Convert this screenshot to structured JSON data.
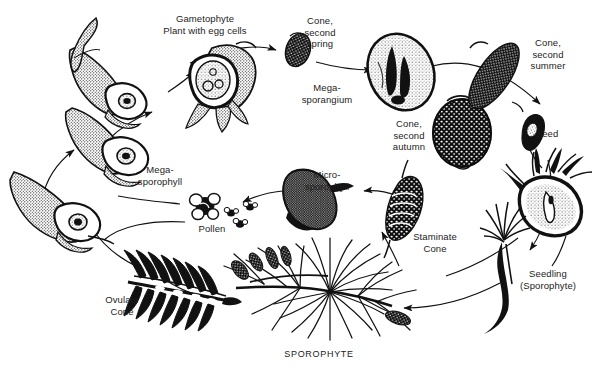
{
  "figure": {
    "background_color": "#ffffff",
    "ink_color": "#111111",
    "text_color": "#1c1c1c",
    "width": 599,
    "height": 374
  },
  "labels": [
    {
      "id": "gametophyte",
      "text": "Gametophyte\nPlant with egg cells",
      "x": 205,
      "y": 21,
      "w": 118
    },
    {
      "id": "cone-second-spring",
      "text": "Cone,\nsecond\nspring",
      "x": 320,
      "y": 27,
      "w": 48
    },
    {
      "id": "megasporangium",
      "text": "Mega-\nsporangium",
      "x": 327,
      "y": 88,
      "w": 64
    },
    {
      "id": "cone-second-summer",
      "text": "Cone,\nsecond\nsummer",
      "x": 548,
      "y": 49,
      "w": 60
    },
    {
      "id": "seed",
      "text": "Seed",
      "x": 547,
      "y": 133,
      "w": 34
    },
    {
      "id": "cone-second-autumn",
      "text": "Cone,\nsecond\nautumn",
      "x": 409,
      "y": 130,
      "w": 52
    },
    {
      "id": "megasporophyll",
      "text": "Mega-\nsporophyll",
      "x": 160,
      "y": 170,
      "w": 62
    },
    {
      "id": "microsporophyll",
      "text": "Micro-\nsporophyll",
      "x": 327,
      "y": 175,
      "w": 60
    },
    {
      "id": "pollen",
      "text": "Pollen",
      "x": 212,
      "y": 228,
      "w": 40
    },
    {
      "id": "staminate-cone",
      "text": "Staminate\nCone",
      "x": 435,
      "y": 237,
      "w": 60
    },
    {
      "id": "seedling",
      "text": "Seedling\n(Sporophyte)",
      "x": 548,
      "y": 274,
      "w": 72
    },
    {
      "id": "ovulate-cone",
      "text": "Ovulate\nCone",
      "x": 122,
      "y": 300,
      "w": 52
    },
    {
      "id": "sporophyte",
      "text": "SPOROPHYTE",
      "x": 319,
      "y": 354,
      "w": 86
    }
  ],
  "stages": [
    {
      "id": "ovule-upper-left",
      "name": "megasporophyll-with-ovule-stage-3"
    },
    {
      "id": "ovule-mid-left",
      "name": "megasporophyll-with-ovule-stage-4"
    },
    {
      "id": "ovule-lower-left",
      "name": "megasporophyll-with-ovule-stage-5"
    },
    {
      "id": "ovule-gametophyte",
      "name": "gametophyte-with-egg-cells"
    },
    {
      "id": "cone-spring-small",
      "name": "cone-second-spring-specimen"
    },
    {
      "id": "megasporangium-ovoid",
      "name": "megasporangium-section"
    },
    {
      "id": "cone-autumn-large",
      "name": "cone-second-autumn-specimen"
    },
    {
      "id": "cone-summer-elongate",
      "name": "cone-second-summer-specimen"
    },
    {
      "id": "seed-winged",
      "name": "winged-seed-specimen"
    },
    {
      "id": "seed-germinating",
      "name": "germinating-seed-section"
    },
    {
      "id": "seedling-young",
      "name": "pine-seedling-specimen"
    },
    {
      "id": "sporophyte-branch",
      "name": "mature-pine-branch"
    },
    {
      "id": "staminate-cone-cluster",
      "name": "staminate-cone-specimen"
    },
    {
      "id": "microsporophyll-scale",
      "name": "microsporophyll-specimen"
    },
    {
      "id": "pollen-grains",
      "name": "pollen-grain-cluster"
    },
    {
      "id": "ovulate-cone-section",
      "name": "ovulate-cone-specimen"
    }
  ]
}
